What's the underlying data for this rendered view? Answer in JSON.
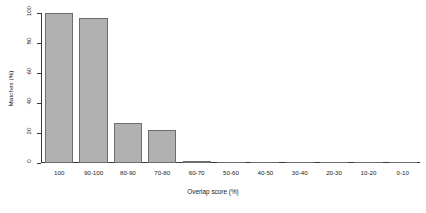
{
  "chart_data": {
    "type": "bar",
    "title": "",
    "xlabel": "Overlap score (%)",
    "ylabel": "Matches (%)",
    "categories": [
      "100",
      "90-100",
      "80-90",
      "70-80",
      "60-70",
      "50-60",
      "40-50",
      "30-40",
      "20-30",
      "10-20",
      "0-10"
    ],
    "values": [
      100,
      97,
      27,
      22,
      1,
      0,
      0,
      0,
      0,
      0,
      0
    ],
    "ylim": [
      0,
      100
    ],
    "yticks": [
      0,
      20,
      40,
      60,
      80,
      100
    ],
    "ytick_labels": [
      "0",
      "20",
      "40",
      "60",
      "80",
      "100"
    ],
    "grid": false,
    "legend": false,
    "bar_color": "#b1b1b1",
    "bar_border_color": "#6d6d6d",
    "axis_color": "#3a3a3a",
    "text_color": "#222222",
    "background": "#ffffff"
  }
}
